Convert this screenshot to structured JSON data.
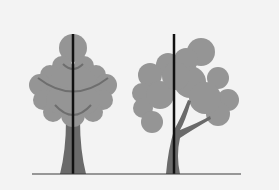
{
  "figure": {
    "colors": {
      "background": "#f3f3f3",
      "canopy": "#959595",
      "canopy_lines": "#6e6e6e",
      "trunk": "#6a6a6a",
      "reference_line": "#111111",
      "ground": "#3a3a3a"
    },
    "trees": [
      {
        "name": "symmetric-tree",
        "axis_x": 73
      },
      {
        "name": "asymmetric-tree",
        "axis_x": 174
      }
    ]
  }
}
